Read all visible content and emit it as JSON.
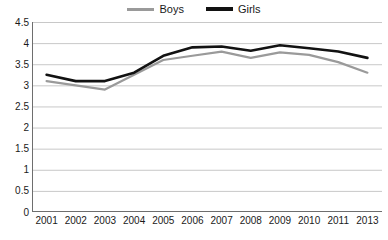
{
  "legend": {
    "position": "top-center",
    "entries": [
      {
        "name": "Boys",
        "color": "#9a9a9a",
        "swatch": "line-swatch-boys"
      },
      {
        "name": "Girls",
        "color": "#121212",
        "swatch": "line-swatch-girls"
      }
    ]
  },
  "chart_data": {
    "type": "line",
    "title": "",
    "subtitle": "",
    "xlabel": "",
    "ylabel": "",
    "categories": [
      "2001",
      "2002",
      "2003",
      "2004",
      "2005",
      "2006",
      "2007",
      "2008",
      "2009",
      "2010",
      "2011",
      "2013"
    ],
    "x": [
      "2001",
      "2002",
      "2003",
      "2004",
      "2005",
      "2006",
      "2007",
      "2008",
      "2009",
      "2010",
      "2011",
      "2013"
    ],
    "series": [
      {
        "name": "Boys",
        "color": "#9a9a9a",
        "values": [
          3.1,
          3.0,
          2.9,
          3.25,
          3.6,
          3.7,
          3.8,
          3.65,
          3.78,
          3.72,
          3.55,
          3.3
        ]
      },
      {
        "name": "Girls",
        "color": "#121212",
        "values": [
          3.25,
          3.1,
          3.1,
          3.3,
          3.7,
          3.9,
          3.92,
          3.82,
          3.95,
          3.88,
          3.8,
          3.65
        ]
      }
    ],
    "ylim": [
      0,
      4.5
    ],
    "yticks": [
      0,
      0.5,
      1,
      1.5,
      2,
      2.5,
      3,
      3.5,
      4,
      4.5
    ],
    "ytick_labels": [
      "0",
      "0.5",
      "1",
      "1.5",
      "2",
      "2.5",
      "3",
      "3.5",
      "4",
      "4.5"
    ],
    "grid": {
      "horizontal": true,
      "vertical": false,
      "color": "#c8c8c8"
    },
    "axis_color": "#6e6e6e",
    "background": "#ffffff",
    "legend_position": "top-center"
  }
}
